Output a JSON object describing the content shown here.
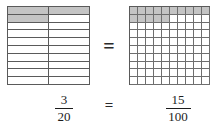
{
  "figure": {
    "equals_symbol": "=",
    "shade_color": "#c4c4c4",
    "line_color": "#5a5a5a"
  },
  "left_model": {
    "name": "twentieths-grid",
    "columns": 2,
    "rows": 10,
    "total_parts": 20,
    "shaded_parts": 3
  },
  "right_model": {
    "name": "hundredths-grid",
    "columns": 10,
    "rows": 10,
    "total_parts": 100,
    "shaded_parts": 15
  },
  "left_fraction": {
    "numerator": "3",
    "denominator": "20"
  },
  "right_fraction": {
    "numerator": "15",
    "denominator": "100"
  },
  "chart_data": {
    "type": "bar",
    "categories": [
      "3/20",
      "15/100"
    ],
    "values": [
      0.15,
      0.15
    ],
    "series": [
      {
        "name": "shaded parts",
        "values": [
          3,
          15
        ]
      },
      {
        "name": "total parts",
        "values": [
          20,
          100
        ]
      }
    ],
    "xlabel": "",
    "ylabel": "fraction shaded",
    "ylim": [
      0,
      1
    ]
  }
}
